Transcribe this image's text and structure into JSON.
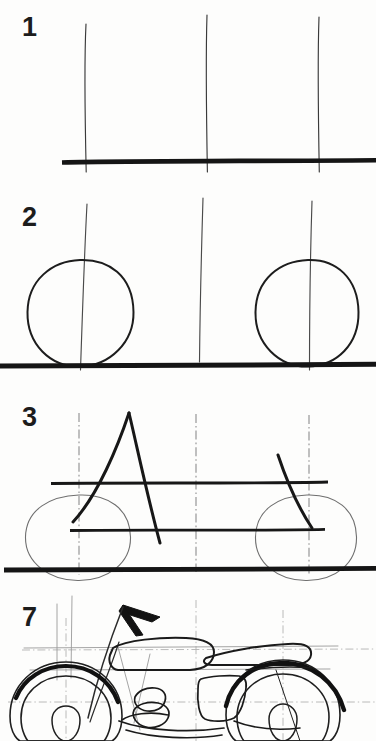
{
  "document": {
    "kind": "scanned-drawing-tutorial",
    "subject": "motorcycle",
    "page_background": "#fdfdfc",
    "ink_color": "#1a1a1a",
    "guide_color": "#8d8d8d"
  },
  "steps": [
    {
      "number": "1",
      "name": "step-1",
      "description": "Three vertical guide lines and a heavy horizontal ground line.",
      "elements": [
        "vertical-guide-left",
        "vertical-guide-middle",
        "vertical-guide-right",
        "ground-line"
      ]
    },
    {
      "number": "2",
      "name": "step-2",
      "description": "Two hand-drawn wheel circles added sitting on the ground line.",
      "elements": [
        "front-wheel-circle",
        "rear-wheel-circle",
        "vertical-guide-left",
        "vertical-guide-middle",
        "vertical-guide-right",
        "ground-line"
      ]
    },
    {
      "number": "3",
      "name": "step-3",
      "description": "Frame construction: upper and lower horizontal rails, A-shaped front frame and slanted rear fork.",
      "elements": [
        "upper-rail",
        "lower-rail",
        "a-frame",
        "rear-fork",
        "front-wheel-circle",
        "rear-wheel-circle",
        "centerlines",
        "ground-line"
      ]
    },
    {
      "number": "7",
      "name": "step-7",
      "description": "Nearly finished motorcycle: fuel tank, long seat, bold front and rear fenders, engine block, side cover and handlebar.",
      "elements": [
        "handlebar-arrow",
        "front-fork",
        "fuel-tank",
        "seat",
        "front-fender",
        "rear-fender",
        "front-wheel",
        "rear-wheel",
        "engine-block",
        "side-cover",
        "exhaust",
        "centerlines"
      ]
    }
  ]
}
